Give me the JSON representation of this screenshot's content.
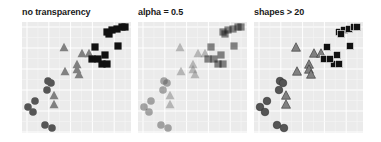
{
  "figure": {
    "background": "#ffffff",
    "panel_background": "#ebebeb",
    "grid_major_color": "#ffffff",
    "grid_minor_color": "#f5f5f5"
  },
  "panels": [
    {
      "title": "no transparency",
      "left": 22,
      "alpha": 1.0,
      "outlined": false
    },
    {
      "title": "alpha = 0.5",
      "left": 138,
      "alpha": 0.5,
      "outlined": false
    },
    {
      "title": "shapes > 20",
      "left": 254,
      "alpha": 1.0,
      "outlined": true
    }
  ],
  "chart_data": [
    {
      "type": "scatter",
      "title": "no transparency",
      "xlabel": "",
      "ylabel": "",
      "xlim": [
        0,
        109
      ],
      "ylim": [
        0,
        111
      ],
      "grid": true,
      "series": [
        {
          "name": "circles",
          "shape": "circle",
          "color": "#555555",
          "points": [
            [
              26,
              59
            ],
            [
              29,
              61
            ],
            [
              25,
              68
            ],
            [
              13,
              79
            ],
            [
              6,
              85
            ],
            [
              11,
              90
            ],
            [
              23,
              103
            ],
            [
              30,
              106
            ]
          ]
        },
        {
          "name": "triangles",
          "shape": "triangle",
          "color": "#808080",
          "points": [
            [
              42,
              26
            ],
            [
              60,
              32
            ],
            [
              67,
              32
            ],
            [
              55,
              43
            ],
            [
              43,
              50
            ],
            [
              55,
              48
            ],
            [
              57,
              53
            ],
            [
              32,
              74
            ],
            [
              32,
              83
            ]
          ]
        },
        {
          "name": "squares",
          "shape": "square",
          "color": "#111111",
          "points": [
            [
              85,
              10
            ],
            [
              90,
              8
            ],
            [
              95,
              7
            ],
            [
              100,
              5
            ],
            [
              103,
              5
            ],
            [
              87,
              12
            ],
            [
              73,
              25
            ],
            [
              96,
              24
            ],
            [
              70,
              37
            ],
            [
              83,
              33
            ],
            [
              80,
              42
            ],
            [
              85,
              42
            ],
            [
              76,
              37
            ]
          ]
        }
      ]
    },
    {
      "type": "scatter",
      "title": "alpha = 0.5",
      "alpha": 0.5,
      "xlim": [
        0,
        109
      ],
      "ylim": [
        0,
        111
      ],
      "grid": true,
      "series_same_as_panel": 0
    },
    {
      "type": "scatter",
      "title": "shapes > 20",
      "filled_outlined_shapes": true,
      "xlim": [
        0,
        109
      ],
      "ylim": [
        0,
        111
      ],
      "grid": true,
      "series_same_as_panel": 0
    }
  ]
}
